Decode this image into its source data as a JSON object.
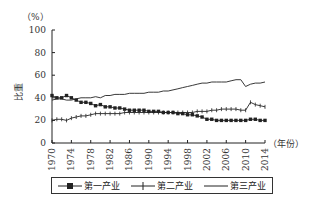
{
  "chart_data": {
    "type": "line",
    "title": "",
    "ylabel": "比重",
    "yunit": "（%）",
    "xlabel": "（年份）",
    "ylim": [
      0,
      100
    ],
    "yticks": [
      0,
      20,
      40,
      60,
      80,
      100
    ],
    "xlim": [
      1970,
      2014
    ],
    "xticks": [
      1970,
      1974,
      1978,
      1982,
      1986,
      1990,
      1994,
      1998,
      2002,
      2006,
      2010,
      2014
    ],
    "grid": false,
    "legend_position": "bottom",
    "x": [
      1970,
      1971,
      1972,
      1973,
      1974,
      1975,
      1976,
      1977,
      1978,
      1979,
      1980,
      1981,
      1982,
      1983,
      1984,
      1985,
      1986,
      1987,
      1988,
      1989,
      1990,
      1991,
      1992,
      1993,
      1994,
      1995,
      1996,
      1997,
      1998,
      1999,
      2000,
      2001,
      2002,
      2003,
      2004,
      2005,
      2006,
      2007,
      2008,
      2009,
      2010,
      2011,
      2012,
      2013,
      2014
    ],
    "series": [
      {
        "name": "第一产业",
        "marker": "square",
        "values": [
          42,
          40,
          40,
          42,
          40,
          38,
          36,
          36,
          35,
          33,
          34,
          32,
          32,
          31,
          31,
          30,
          29,
          29,
          29,
          29,
          28,
          28,
          28,
          27,
          27,
          27,
          26,
          26,
          25,
          25,
          24,
          23,
          21,
          21,
          20,
          20,
          20,
          20,
          20,
          20,
          20,
          21,
          21,
          20,
          20
        ]
      },
      {
        "name": "第二产业",
        "marker": "plus",
        "values": [
          20,
          21,
          21,
          20,
          22,
          23,
          24,
          24,
          25,
          26,
          26,
          26,
          26,
          26,
          26,
          27,
          27,
          27,
          27,
          27,
          27,
          27,
          27,
          27,
          27,
          27,
          27,
          27,
          27,
          27,
          28,
          28,
          28,
          29,
          29,
          30,
          30,
          30,
          30,
          29,
          29,
          36,
          34,
          33,
          32
        ]
      },
      {
        "name": "第三产业",
        "marker": "none",
        "values": [
          38,
          39,
          39,
          38,
          38,
          39,
          40,
          40,
          40,
          41,
          40,
          42,
          42,
          43,
          43,
          43,
          44,
          44,
          44,
          44,
          45,
          45,
          45,
          46,
          46,
          47,
          48,
          49,
          50,
          51,
          52,
          53,
          53,
          54,
          54,
          54,
          54,
          55,
          56,
          56,
          50,
          52,
          53,
          53,
          54
        ]
      }
    ]
  }
}
